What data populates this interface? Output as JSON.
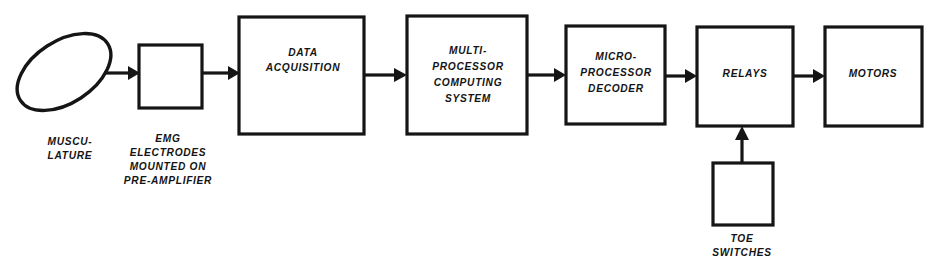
{
  "diagram": {
    "background_color": "#ffffff",
    "line_color": "#151515",
    "nodes": [
      {
        "id": "musculature",
        "shape": "ellipse",
        "label_lines": [],
        "caption_lines": [
          "MUSCU-",
          "LATURE"
        ]
      },
      {
        "id": "emg-electrodes",
        "shape": "rect",
        "label_lines": [],
        "caption_lines": [
          "EMG",
          "ELECTRODES",
          "MOUNTED ON",
          "PRE-AMPLIFIER"
        ]
      },
      {
        "id": "data-acquisition",
        "shape": "rect",
        "label_lines": [
          "DATA",
          "ACQUISITION"
        ],
        "caption_lines": []
      },
      {
        "id": "multiprocessor-computing-system",
        "shape": "rect",
        "label_lines": [
          "MULTI-",
          "PROCESSOR",
          "COMPUTING",
          "SYSTEM"
        ],
        "caption_lines": []
      },
      {
        "id": "microprocessor-decoder",
        "shape": "rect",
        "label_lines": [
          "MICRO-",
          "PROCESSOR",
          "DECODER"
        ],
        "caption_lines": []
      },
      {
        "id": "relays",
        "shape": "rect",
        "label_lines": [
          "RELAYS"
        ],
        "caption_lines": []
      },
      {
        "id": "motors",
        "shape": "rect",
        "label_lines": [
          "MOTORS"
        ],
        "caption_lines": []
      },
      {
        "id": "toe-switches",
        "shape": "rect",
        "label_lines": [],
        "caption_lines": [
          "TOE",
          "SWITCHES"
        ]
      }
    ],
    "labels": {
      "musculature_1": "MUSCU-",
      "musculature_2": "LATURE",
      "emg_1": "EMG",
      "emg_2": "ELECTRODES",
      "emg_3": "MOUNTED ON",
      "emg_4": "PRE-AMPLIFIER",
      "daq_1": "DATA",
      "daq_2": "ACQUISITION",
      "mpcs_1": "MULTI-",
      "mpcs_2": "PROCESSOR",
      "mpcs_3": "COMPUTING",
      "mpcs_4": "SYSTEM",
      "mpd_1": "MICRO-",
      "mpd_2": "PROCESSOR",
      "mpd_3": "DECODER",
      "relays_1": "RELAYS",
      "motors_1": "MOTORS",
      "toe_1": "TOE",
      "toe_2": "SWITCHES"
    },
    "connections": [
      {
        "id": "musculature-to-emg",
        "from": "musculature",
        "to": "emg-electrodes",
        "direction": "right"
      },
      {
        "id": "emg-to-daq",
        "from": "emg-electrodes",
        "to": "data-acquisition",
        "direction": "right"
      },
      {
        "id": "daq-to-mpcs",
        "from": "data-acquisition",
        "to": "multiprocessor-computing-system",
        "direction": "right"
      },
      {
        "id": "mpcs-to-mpd",
        "from": "multiprocessor-computing-system",
        "to": "microprocessor-decoder",
        "direction": "right"
      },
      {
        "id": "mpd-to-relays",
        "from": "microprocessor-decoder",
        "to": "relays",
        "direction": "right"
      },
      {
        "id": "relays-to-motors",
        "from": "relays",
        "to": "motors",
        "direction": "right"
      },
      {
        "id": "toe-switches-to-relays",
        "from": "toe-switches",
        "to": "relays",
        "direction": "up"
      }
    ]
  }
}
